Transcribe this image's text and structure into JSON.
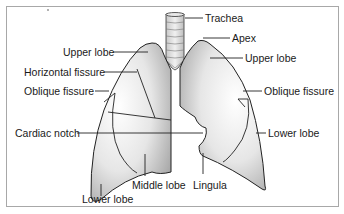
{
  "diagram": {
    "labels": {
      "trachea": "Trachea",
      "apex": "Apex",
      "upper_lobe_left_side": "Upper lobe",
      "upper_lobe_right_side": "Upper lobe",
      "horizontal_fissure": "Horizontal fissure",
      "oblique_fissure_left_side": "Oblique fissure",
      "oblique_fissure_right_side": "Oblique fissure",
      "cardiac_notch": "Cardiac notch",
      "lower_lobe_right_side": "Lower lobe",
      "lower_lobe_bottom": "Lower lobe",
      "middle_lobe": "Middle lobe",
      "lingula": "Lingula"
    },
    "colors": {
      "lung_fill_light": "#f4f4f4",
      "lung_fill_dark": "#b9b9b9",
      "outline": "#222222",
      "frame": "#a8a8a8"
    }
  }
}
